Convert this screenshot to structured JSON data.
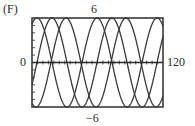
{
  "panel": {
    "label": "(F)"
  },
  "window": {
    "xmin_label": "0",
    "xmax_label": "120",
    "ymax_label": "6",
    "ymin_label": "−6"
  },
  "colors": {
    "curve": "#3a3a3a",
    "frame": "#3a3a3a",
    "axis": "#2a2a2a"
  },
  "chart_data": {
    "type": "line",
    "title": "(F)",
    "xlabel": "",
    "ylabel": "",
    "xlim": [
      0,
      120
    ],
    "ylim": [
      -6,
      6
    ],
    "grid": false,
    "axis_ticks": {
      "x_tick_step": 5,
      "y_tick_step": 1
    },
    "series": [
      {
        "name": "curve-1",
        "amplitude": 6,
        "period": 55,
        "peak_t": 4.6
      },
      {
        "name": "curve-2",
        "amplitude": 6,
        "period": 55,
        "peak_t": 18.3
      },
      {
        "name": "curve-3",
        "amplitude": 6,
        "period": 55,
        "peak_t": 31.1
      }
    ]
  }
}
